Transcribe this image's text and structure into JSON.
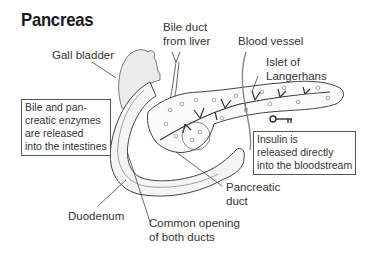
{
  "title": "Pancreas",
  "labels": {
    "gall_bladder": "Gall bladder",
    "bile_duct_line1": "Bile duct",
    "bile_duct_line2": "from liver",
    "blood_vessel": "Blood vessel",
    "islet_line1": "Islet of",
    "islet_line2": "Langerhans",
    "duodenum": "Duodenum",
    "common_opening_line1": "Common opening",
    "common_opening_line2": "of both ducts",
    "pancreatic_duct_line1": "Pancreatic",
    "pancreatic_duct_line2": "duct"
  },
  "boxes": {
    "exocrine": [
      "Bile and pan-",
      "creatic enzymes",
      "are released",
      "into the intestines"
    ],
    "endocrine": [
      "Insulin is",
      "released directly",
      "into the bloodstream"
    ]
  },
  "icons": {
    "key": "key-icon"
  },
  "colors": {
    "line": "#444444",
    "text": "#333333",
    "shading": "#e6e6e6"
  }
}
